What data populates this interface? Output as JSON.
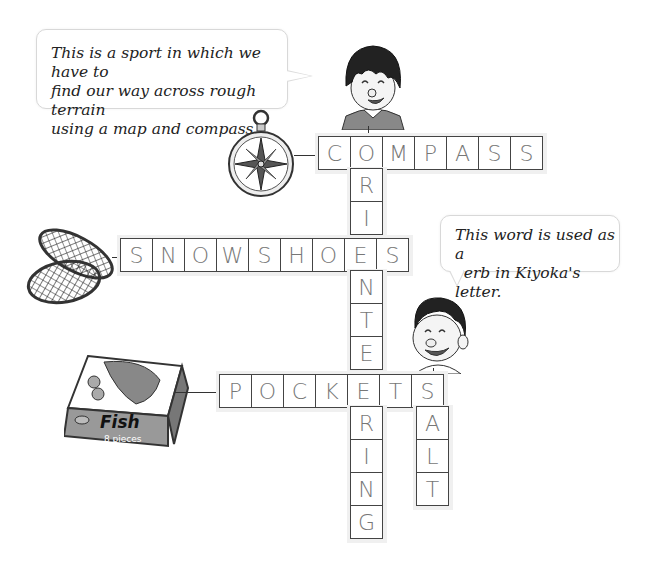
{
  "clues": {
    "bubble_1": {
      "lines": [
        "This is a sport in which we have to",
        "find our way across rough terrain",
        "using a map and compass."
      ]
    },
    "bubble_2": {
      "lines": [
        "This word is used as a",
        "verb in Kiyoka's letter."
      ]
    }
  },
  "pictures": {
    "compass": {
      "icon": "compass-icon"
    },
    "snowshoes": {
      "icon": "snowshoes-icon"
    },
    "fish_box": {
      "icon": "fish-box-icon",
      "label": "Fish",
      "sublabel": "8 pieces"
    },
    "girl": {
      "icon": "girl-character-icon"
    },
    "boy": {
      "icon": "boy-character-icon"
    }
  },
  "crossword": {
    "words": [
      {
        "id": "compass",
        "direction": "across",
        "letters": [
          "C",
          "O",
          "M",
          "P",
          "A",
          "S",
          "S"
        ]
      },
      {
        "id": "snowshoes",
        "direction": "across",
        "letters": [
          "S",
          "N",
          "O",
          "W",
          "S",
          "H",
          "O",
          "E",
          "S"
        ]
      },
      {
        "id": "pockets",
        "direction": "across",
        "letters": [
          "P",
          "O",
          "C",
          "K",
          "E",
          "T",
          "S"
        ]
      },
      {
        "id": "orienteering",
        "direction": "down",
        "letters": [
          "O",
          "R",
          "I",
          "E",
          "N",
          "T",
          "E",
          "E",
          "R",
          "I",
          "N",
          "G"
        ]
      },
      {
        "id": "salt",
        "direction": "down",
        "letters": [
          "S",
          "A",
          "L",
          "T"
        ]
      }
    ],
    "cells": {
      "compass": [
        "C",
        "O",
        "M",
        "P",
        "A",
        "S",
        "S"
      ],
      "orienteering_tail_1": [
        "R",
        "I"
      ],
      "snowshoes": [
        "S",
        "N",
        "O",
        "W",
        "S",
        "H",
        "O",
        "E",
        "S"
      ],
      "orienteering_tail_2": [
        "N",
        "T",
        "E"
      ],
      "pockets": [
        "P",
        "O",
        "C",
        "K",
        "E",
        "T",
        "S"
      ],
      "orienteering_tail_3": [
        "R",
        "I",
        "N",
        "G"
      ],
      "salt_tail": [
        "A",
        "L",
        "T"
      ]
    }
  }
}
